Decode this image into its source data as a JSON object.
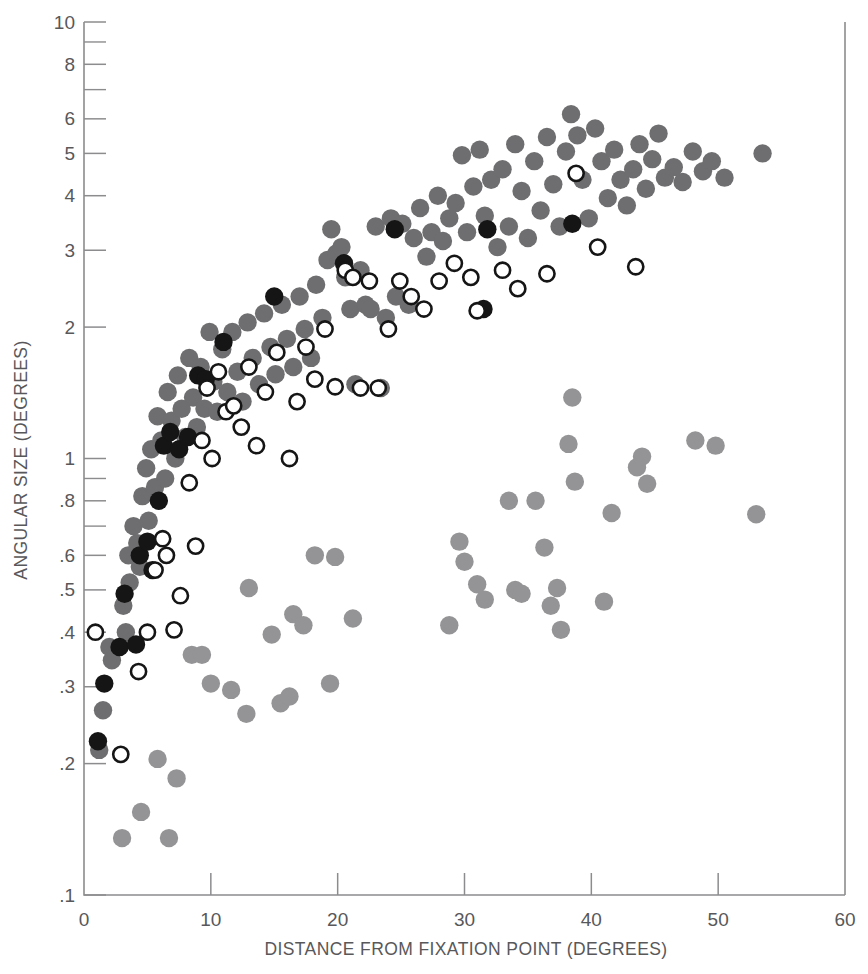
{
  "chart_data": {
    "type": "scatter",
    "title": "",
    "xlabel": "DISTANCE FROM FIXATION POINT (DEGREES)",
    "ylabel": "ANGULAR SIZE (DEGREES)",
    "xlim": [
      0,
      60
    ],
    "ylim": [
      0.1,
      10
    ],
    "yscale": "log",
    "xscale": "linear",
    "grid": false,
    "legend": "none",
    "xticks": [
      0,
      10,
      20,
      30,
      40,
      50,
      60
    ],
    "xticklabels": [
      "0",
      "10",
      "20",
      "30",
      "40",
      "50",
      "60"
    ],
    "yticks": [
      0.1,
      0.2,
      0.3,
      0.4,
      0.5,
      0.6,
      0.8,
      1,
      2,
      3,
      4,
      5,
      6,
      8,
      10
    ],
    "yticklabels": [
      ".1",
      ".2",
      ".3",
      ".4",
      ".5",
      ".6",
      ".8",
      "1",
      "2",
      "3",
      "4",
      "5",
      "6",
      "8",
      "10"
    ],
    "yminorticks": [
      0.7,
      0.9,
      7,
      9
    ],
    "colors": {
      "dark_gray": "#6e6e70",
      "black": "#151515",
      "open": "#151515",
      "light_gray": "#949496",
      "axis": "#8c8c8e",
      "text": "#58585a",
      "background": "#ffffff"
    },
    "series": [
      {
        "name": "dark-gray-filled",
        "marker": "filled-circle",
        "color": "#6e6e70",
        "points": [
          [
            1.2,
            0.215
          ],
          [
            1.5,
            0.265
          ],
          [
            2.0,
            0.37
          ],
          [
            2.2,
            0.345
          ],
          [
            3.1,
            0.46
          ],
          [
            3.3,
            0.4
          ],
          [
            3.5,
            0.6
          ],
          [
            3.6,
            0.52
          ],
          [
            3.9,
            0.7
          ],
          [
            4.2,
            0.64
          ],
          [
            4.4,
            0.565
          ],
          [
            4.6,
            0.82
          ],
          [
            4.9,
            0.95
          ],
          [
            5.1,
            0.72
          ],
          [
            5.3,
            1.05
          ],
          [
            5.6,
            0.86
          ],
          [
            5.8,
            1.25
          ],
          [
            6.1,
            1.1
          ],
          [
            6.4,
            0.9
          ],
          [
            6.6,
            1.42
          ],
          [
            6.9,
            1.22
          ],
          [
            7.2,
            1.0
          ],
          [
            7.4,
            1.55
          ],
          [
            7.7,
            1.3
          ],
          [
            8.0,
            1.12
          ],
          [
            8.3,
            1.7
          ],
          [
            8.6,
            1.38
          ],
          [
            8.9,
            1.18
          ],
          [
            9.2,
            1.62
          ],
          [
            9.5,
            1.3
          ],
          [
            9.9,
            1.95
          ],
          [
            10.2,
            1.5
          ],
          [
            10.5,
            1.28
          ],
          [
            10.9,
            1.78
          ],
          [
            11.3,
            1.42
          ],
          [
            11.7,
            1.95
          ],
          [
            12.1,
            1.58
          ],
          [
            12.5,
            1.35
          ],
          [
            12.9,
            2.05
          ],
          [
            13.3,
            1.7
          ],
          [
            13.8,
            1.48
          ],
          [
            14.2,
            2.15
          ],
          [
            14.7,
            1.8
          ],
          [
            15.1,
            1.56
          ],
          [
            15.6,
            2.25
          ],
          [
            16.0,
            1.88
          ],
          [
            16.5,
            1.62
          ],
          [
            17.0,
            2.35
          ],
          [
            17.4,
            1.98
          ],
          [
            17.9,
            1.7
          ],
          [
            18.3,
            2.5
          ],
          [
            18.8,
            2.1
          ],
          [
            19.2,
            2.85
          ],
          [
            19.5,
            3.35
          ],
          [
            19.9,
            2.95
          ],
          [
            20.3,
            3.05
          ],
          [
            20.6,
            2.6
          ],
          [
            21.0,
            2.2
          ],
          [
            21.4,
            1.48
          ],
          [
            21.8,
            2.7
          ],
          [
            22.2,
            2.25
          ],
          [
            22.6,
            2.2
          ],
          [
            23.0,
            3.4
          ],
          [
            23.4,
            1.45
          ],
          [
            23.8,
            2.1
          ],
          [
            24.2,
            3.55
          ],
          [
            24.6,
            2.35
          ],
          [
            25.1,
            3.45
          ],
          [
            25.6,
            2.25
          ],
          [
            26.0,
            3.2
          ],
          [
            26.5,
            3.75
          ],
          [
            27.0,
            2.9
          ],
          [
            27.4,
            3.3
          ],
          [
            27.9,
            4.0
          ],
          [
            28.3,
            3.15
          ],
          [
            28.8,
            3.55
          ],
          [
            29.3,
            3.85
          ],
          [
            29.8,
            4.95
          ],
          [
            30.2,
            3.3
          ],
          [
            30.7,
            4.2
          ],
          [
            31.2,
            5.1
          ],
          [
            31.6,
            3.6
          ],
          [
            32.1,
            4.35
          ],
          [
            32.6,
            3.05
          ],
          [
            33.0,
            4.6
          ],
          [
            33.5,
            3.4
          ],
          [
            34.0,
            5.25
          ],
          [
            34.5,
            4.1
          ],
          [
            35.0,
            3.2
          ],
          [
            35.5,
            4.8
          ],
          [
            36.0,
            3.7
          ],
          [
            36.5,
            5.45
          ],
          [
            37.0,
            4.25
          ],
          [
            37.5,
            3.4
          ],
          [
            38.0,
            5.05
          ],
          [
            38.4,
            6.15
          ],
          [
            38.9,
            5.5
          ],
          [
            39.3,
            4.35
          ],
          [
            39.8,
            3.55
          ],
          [
            40.3,
            5.7
          ],
          [
            40.8,
            4.8
          ],
          [
            41.3,
            3.95
          ],
          [
            41.8,
            5.1
          ],
          [
            42.3,
            4.35
          ],
          [
            42.8,
            3.8
          ],
          [
            43.3,
            4.6
          ],
          [
            43.8,
            5.25
          ],
          [
            44.3,
            4.15
          ],
          [
            44.8,
            4.85
          ],
          [
            45.3,
            5.55
          ],
          [
            45.8,
            4.4
          ],
          [
            46.5,
            4.65
          ],
          [
            47.2,
            4.3
          ],
          [
            48.0,
            5.05
          ],
          [
            48.8,
            4.55
          ],
          [
            49.5,
            4.8
          ],
          [
            50.5,
            4.4
          ],
          [
            53.5,
            5.0
          ]
        ]
      },
      {
        "name": "black-filled",
        "marker": "filled-circle",
        "color": "#151515",
        "points": [
          [
            1.1,
            0.225
          ],
          [
            1.6,
            0.305
          ],
          [
            2.8,
            0.37
          ],
          [
            3.2,
            0.49
          ],
          [
            4.1,
            0.375
          ],
          [
            4.4,
            0.6
          ],
          [
            5.0,
            0.645
          ],
          [
            5.4,
            0.555
          ],
          [
            5.9,
            0.8
          ],
          [
            6.3,
            1.07
          ],
          [
            6.8,
            1.15
          ],
          [
            7.5,
            1.05
          ],
          [
            8.2,
            1.12
          ],
          [
            9.0,
            1.55
          ],
          [
            9.6,
            1.52
          ],
          [
            11.0,
            1.85
          ],
          [
            15.0,
            2.35
          ],
          [
            20.5,
            2.8
          ],
          [
            24.5,
            3.35
          ],
          [
            31.5,
            2.2
          ],
          [
            31.8,
            3.35
          ],
          [
            38.5,
            3.45
          ]
        ]
      },
      {
        "name": "open-circle",
        "marker": "open-circle",
        "color": "#151515",
        "points": [
          [
            0.9,
            0.4
          ],
          [
            2.9,
            0.21
          ],
          [
            4.3,
            0.325
          ],
          [
            5.0,
            0.4
          ],
          [
            5.6,
            0.555
          ],
          [
            6.2,
            0.655
          ],
          [
            6.5,
            0.6
          ],
          [
            7.1,
            0.405
          ],
          [
            7.6,
            0.485
          ],
          [
            8.3,
            0.88
          ],
          [
            8.8,
            0.63
          ],
          [
            9.3,
            1.1
          ],
          [
            9.7,
            1.45
          ],
          [
            10.1,
            1.0
          ],
          [
            10.6,
            1.58
          ],
          [
            11.2,
            1.28
          ],
          [
            11.8,
            1.32
          ],
          [
            12.4,
            1.18
          ],
          [
            13.0,
            1.62
          ],
          [
            13.6,
            1.07
          ],
          [
            14.3,
            1.42
          ],
          [
            15.2,
            1.75
          ],
          [
            16.2,
            1.0
          ],
          [
            16.8,
            1.35
          ],
          [
            17.5,
            1.8
          ],
          [
            18.2,
            1.52
          ],
          [
            19.0,
            1.98
          ],
          [
            19.8,
            1.46
          ],
          [
            20.6,
            2.7
          ],
          [
            21.2,
            2.6
          ],
          [
            21.8,
            1.45
          ],
          [
            22.5,
            2.55
          ],
          [
            23.2,
            1.45
          ],
          [
            24.0,
            1.98
          ],
          [
            24.9,
            2.55
          ],
          [
            25.8,
            2.35
          ],
          [
            26.8,
            2.2
          ],
          [
            28.0,
            2.55
          ],
          [
            29.2,
            2.8
          ],
          [
            30.5,
            2.6
          ],
          [
            31.0,
            2.18
          ],
          [
            33.0,
            2.7
          ],
          [
            34.2,
            2.45
          ],
          [
            36.5,
            2.65
          ],
          [
            38.8,
            4.5
          ],
          [
            40.5,
            3.05
          ],
          [
            43.5,
            2.75
          ]
        ]
      },
      {
        "name": "light-gray-filled",
        "marker": "filled-circle",
        "color": "#949496",
        "points": [
          [
            3.0,
            0.135
          ],
          [
            4.5,
            0.155
          ],
          [
            5.8,
            0.205
          ],
          [
            6.7,
            0.135
          ],
          [
            7.3,
            0.185
          ],
          [
            8.5,
            0.355
          ],
          [
            9.3,
            0.355
          ],
          [
            10.0,
            0.305
          ],
          [
            11.6,
            0.295
          ],
          [
            12.8,
            0.26
          ],
          [
            13.0,
            0.505
          ],
          [
            14.8,
            0.395
          ],
          [
            15.5,
            0.275
          ],
          [
            16.2,
            0.285
          ],
          [
            16.5,
            0.44
          ],
          [
            17.3,
            0.415
          ],
          [
            18.2,
            0.6
          ],
          [
            19.4,
            0.305
          ],
          [
            19.8,
            0.595
          ],
          [
            21.2,
            0.43
          ],
          [
            28.8,
            0.415
          ],
          [
            29.6,
            0.645
          ],
          [
            30.0,
            0.58
          ],
          [
            31.0,
            0.515
          ],
          [
            31.6,
            0.475
          ],
          [
            33.5,
            0.8
          ],
          [
            34.0,
            0.5
          ],
          [
            34.5,
            0.49
          ],
          [
            35.6,
            0.8
          ],
          [
            36.3,
            0.625
          ],
          [
            36.8,
            0.46
          ],
          [
            37.3,
            0.505
          ],
          [
            37.6,
            0.405
          ],
          [
            38.2,
            1.08
          ],
          [
            38.5,
            1.38
          ],
          [
            38.7,
            0.885
          ],
          [
            41.0,
            0.47
          ],
          [
            41.6,
            0.75
          ],
          [
            43.6,
            0.955
          ],
          [
            44.0,
            1.01
          ],
          [
            44.4,
            0.875
          ],
          [
            48.2,
            1.1
          ],
          [
            49.8,
            1.07
          ],
          [
            53.0,
            0.745
          ]
        ]
      }
    ]
  }
}
